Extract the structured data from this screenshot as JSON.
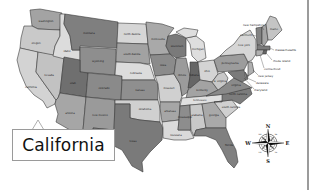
{
  "map": {
    "title": "United States Map",
    "highlighted_state": "California",
    "callout_label": "California",
    "colors": {
      "light": "#cfcfcf",
      "lighter": "#dedede",
      "mid": "#a8a8a8",
      "dark": "#7d7d7d",
      "darker": "#6a6a6a",
      "border": "#3a3a3a",
      "callout_border": "#9a9a9a",
      "frame": "#9b9b9b"
    },
    "state_labels": {
      "washington": "washington",
      "oregon": "oregon",
      "california": "california",
      "nevada": "nevada",
      "idaho": "idaho",
      "montana": "montana",
      "wyoming": "wyoming",
      "utah": "utah",
      "arizona": "arizona",
      "colorado": "colorado",
      "new_mexico": "new mexico",
      "north_dakota": "north dakota",
      "south_dakota": "south dakota",
      "nebraska": "nebraska",
      "kansas": "kansas",
      "oklahoma": "oklahoma",
      "texas": "texas",
      "minnesota": "minnesota",
      "iowa": "iowa",
      "missouri": "missouri",
      "arkansas": "arkansas",
      "louisiana": "louisiana",
      "wisconsin": "wisconsin",
      "illinois": "illinois",
      "michigan": "michigan",
      "indiana": "indiana",
      "ohio": "ohio",
      "kentucky": "kentucky",
      "tennessee": "tennessee",
      "mississippi": "mississippi",
      "alabama": "alabama",
      "georgia": "georgia",
      "florida": "florida",
      "south_carolina": "south carolina",
      "north_carolina": "north carolina",
      "virginia": "virginia",
      "west_virginia": "w. virginia",
      "pennsylvania": "pennsylvania",
      "new_york": "new york",
      "maine": "maine"
    },
    "northeast_callouts": {
      "new_hampshire": "new hampshire",
      "vermont": "vermont",
      "massachusetts": "massachusetts",
      "rhode_island": "rhode island",
      "connecticut": "connecticut",
      "new_jersey": "new jersey",
      "delaware": "delaware",
      "maryland": "maryland"
    },
    "compass": {
      "n": "N",
      "s": "S",
      "e": "E",
      "w": "W",
      "ne": "NE",
      "nw": "NW",
      "se": "SE",
      "sw": "SW"
    }
  }
}
